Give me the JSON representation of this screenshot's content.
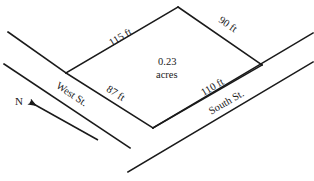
{
  "diagram": {
    "ink_color": "#1a1a1a",
    "background_color": "#ffffff",
    "parcel": {
      "area_value": "0.23",
      "area_unit": "acres",
      "sides": [
        {
          "name": "northwest-side",
          "label": "115 ft"
        },
        {
          "name": "northeast-side",
          "label": "90 ft"
        },
        {
          "name": "southwest-side",
          "label": "87 ft"
        },
        {
          "name": "southeast-side",
          "label": "110 ft"
        }
      ]
    },
    "streets": [
      {
        "name": "west-street",
        "label": "West St."
      },
      {
        "name": "south-street",
        "label": "South St."
      }
    ],
    "compass": {
      "label": "N",
      "direction": "up-left"
    }
  }
}
